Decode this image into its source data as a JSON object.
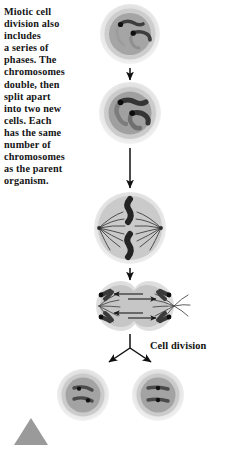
{
  "figure": {
    "caption": "Miotic cell\ndivision also\nincludes\na series of\nphases. The\nchromosomes\ndouble, then\nsplit apart\ninto two new\ncells. Each\nhas the same\nnumber of\nchromosomes\nas the parent\norganism.",
    "stage_label": "Cell division",
    "colors": {
      "text": "#141414",
      "background": "#ffffff",
      "cell_outer": "#e2e2e2",
      "cell_membrane": "#cfcfcf",
      "cytoplasm": "#a8a8a8",
      "chromosome": "#3a3a3a",
      "chromosome_dark": "#1b1b1b",
      "spindle": "#4a4a4a",
      "arrow": "#111111",
      "marker": "#9a9a9a"
    },
    "stages": [
      {
        "name": "interphase-cell",
        "label": "",
        "chromosome_count": 2,
        "description": "single cell with two thin chromosomes"
      },
      {
        "name": "prophase-cell",
        "label": "",
        "chromosome_count": 2,
        "description": "chromosomes doubled and thickened"
      },
      {
        "name": "metaphase-cell",
        "label": "",
        "chromosome_count": 2,
        "description": "chromosomes aligned at centre with spindle fibres at both poles"
      },
      {
        "name": "anaphase-cell",
        "label": "",
        "chromosome_count": 4,
        "description": "elongated dumbbell cell, chromatids pulled to opposite poles"
      },
      {
        "name": "daughter-cell-left",
        "label": "",
        "chromosome_count": 2,
        "description": "new daughter cell"
      },
      {
        "name": "daughter-cell-right",
        "label": "",
        "chromosome_count": 2,
        "description": "new daughter cell"
      }
    ]
  }
}
